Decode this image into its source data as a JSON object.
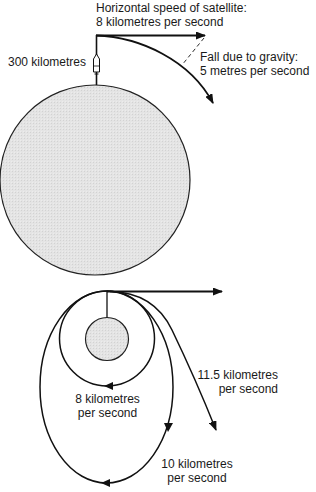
{
  "top_diagram": {
    "horizontal_speed_label": {
      "line1": "Horizontal speed of satellite:",
      "line2": "8 kilometres per second"
    },
    "altitude_label": "300 kilometres",
    "gravity_fall_label": {
      "line1": "Fall due to gravity:",
      "line2": "5 metres per second"
    }
  },
  "bottom_diagram": {
    "orbit_labels": [
      {
        "id": "circular",
        "line1": "8 kilometres",
        "line2": "per second"
      },
      {
        "id": "escape",
        "line1": "11.5 kilometres",
        "line2": "per second"
      },
      {
        "id": "elliptical",
        "line1": "10 kilometres",
        "line2": "per second"
      }
    ]
  },
  "colors": {
    "line": "#111111",
    "planet_fill": "#e2e2e2",
    "background": "#ffffff"
  }
}
